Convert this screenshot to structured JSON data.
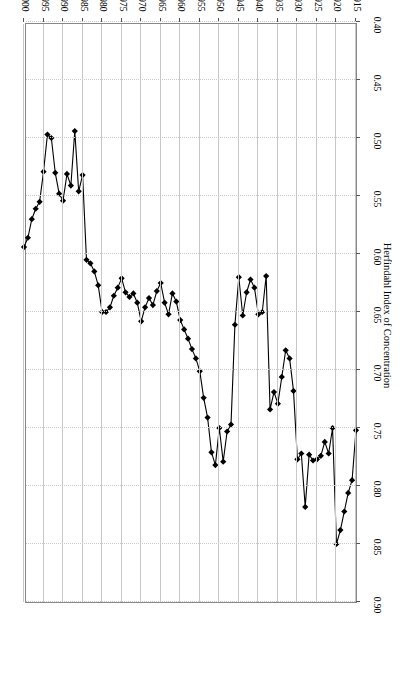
{
  "figure": {
    "type": "line-chart",
    "rotated_180": true
  },
  "chart_data": {
    "type": "line",
    "title": "",
    "xlabel": "Year",
    "ylabel": "Herfindahl Index of Concentration",
    "xlim": [
      1915,
      2000
    ],
    "ylim": [
      0.4,
      0.9
    ],
    "xticks": [
      1915,
      1920,
      1925,
      1930,
      1935,
      1940,
      1945,
      1950,
      1955,
      1960,
      1965,
      1970,
      1975,
      1980,
      1985,
      1990,
      1995,
      2000
    ],
    "yticks": [
      0.4,
      0.45,
      0.5,
      0.55,
      0.6,
      0.65,
      0.7,
      0.75,
      0.8,
      0.85,
      0.9
    ],
    "xtick_labels": [
      "1915",
      "1920",
      "1925",
      "1930",
      "1935",
      "1940",
      "1945",
      "1950",
      "1955",
      "1960",
      "1965",
      "1970",
      "1975",
      "1980",
      "1985",
      "1990",
      "1995",
      "2000"
    ],
    "ytick_labels": [
      "0.40",
      "0.45",
      "0.50",
      "0.55",
      "0.60",
      "0.65",
      "0.70",
      "0.75",
      "0.80",
      "0.85",
      "0.90"
    ],
    "grid": true,
    "legend": null,
    "marker": "filled-diamond",
    "line_color": "#000000",
    "marker_color": "#000000",
    "x": [
      1915,
      1916,
      1917,
      1918,
      1919,
      1920,
      1921,
      1922,
      1923,
      1924,
      1925,
      1926,
      1927,
      1928,
      1929,
      1930,
      1931,
      1932,
      1933,
      1934,
      1935,
      1936,
      1937,
      1938,
      1939,
      1940,
      1941,
      1942,
      1943,
      1944,
      1945,
      1946,
      1947,
      1948,
      1949,
      1950,
      1951,
      1952,
      1953,
      1954,
      1955,
      1956,
      1957,
      1958,
      1959,
      1960,
      1961,
      1962,
      1963,
      1964,
      1965,
      1966,
      1967,
      1968,
      1969,
      1970,
      1971,
      1972,
      1973,
      1974,
      1975,
      1976,
      1977,
      1978,
      1979,
      1980,
      1981,
      1982,
      1983,
      1984,
      1985,
      1986,
      1987,
      1988,
      1989,
      1990,
      1991,
      1992,
      1993,
      1994,
      1995,
      1996,
      1997,
      1998,
      1999,
      2000
    ],
    "y": [
      0.752,
      0.795,
      0.806,
      0.822,
      0.838,
      0.85,
      0.75,
      0.772,
      0.762,
      0.774,
      0.777,
      0.778,
      0.773,
      0.818,
      0.772,
      0.777,
      0.718,
      0.69,
      0.683,
      0.706,
      0.729,
      0.719,
      0.734,
      0.619,
      0.65,
      0.652,
      0.629,
      0.622,
      0.633,
      0.653,
      0.62,
      0.661,
      0.747,
      0.753,
      0.779,
      0.75,
      0.782,
      0.771,
      0.741,
      0.724,
      0.701,
      0.69,
      0.682,
      0.673,
      0.665,
      0.657,
      0.641,
      0.634,
      0.652,
      0.642,
      0.625,
      0.632,
      0.644,
      0.638,
      0.646,
      0.658,
      0.642,
      0.634,
      0.637,
      0.633,
      0.621,
      0.629,
      0.636,
      0.646,
      0.65,
      0.65,
      0.627,
      0.615,
      0.608,
      0.605,
      0.532,
      0.546,
      0.494,
      0.541,
      0.531,
      0.554,
      0.548,
      0.53,
      0.5,
      0.497,
      0.529,
      0.555,
      0.561,
      0.57,
      0.586,
      0.594
    ]
  },
  "axis_titles": {
    "x": "Year",
    "y": "Herfindahl Index of Concentration"
  }
}
